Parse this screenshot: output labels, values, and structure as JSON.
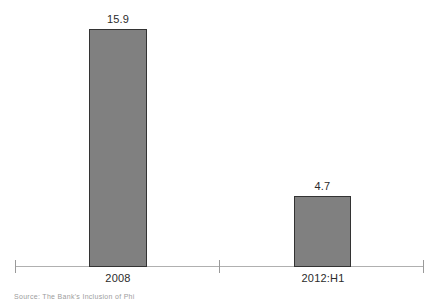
{
  "chart_data": {
    "type": "bar",
    "title": "",
    "subtitle": "",
    "xlabel": "",
    "ylabel": "",
    "categories": [
      "2008",
      "2012:H1"
    ],
    "values": [
      15.9,
      4.7
    ],
    "value_labels": [
      "15.9",
      "4.7"
    ],
    "series": [
      {
        "name": "",
        "values": [
          15.9,
          4.7
        ]
      }
    ],
    "ylim": [
      0,
      17.8
    ],
    "grid": false,
    "legend": null,
    "legend_position": "none",
    "axis": {
      "x_axis_visible": true,
      "y_axis_visible": false,
      "tick_marks": 3,
      "tick_labels": [
        "",
        "",
        ""
      ]
    },
    "annotations": [],
    "colors": {
      "bar_fill": "#808080",
      "bar_border": "#333333",
      "axis_line": "#b0b0b0",
      "tick": "#9a9a9a",
      "text": "#2b2b2b",
      "background": "#ffffff",
      "source_text": "#9d9d9d"
    }
  },
  "footer": {
    "source_note": "Source: The Bank's Inclusion of Phi"
  }
}
